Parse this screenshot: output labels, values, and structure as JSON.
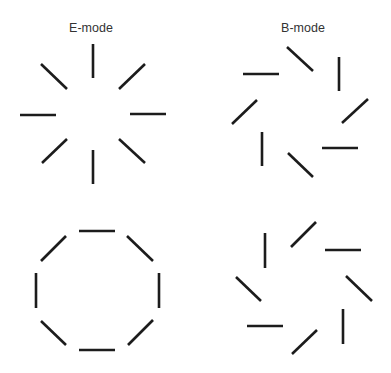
{
  "panels": [
    {
      "id": "e-mode-radial",
      "title": "E-mode",
      "pattern": "radial",
      "segment_count": 8,
      "segment_orientations_deg": [
        90,
        45,
        0,
        135,
        90,
        45,
        0,
        135
      ]
    },
    {
      "id": "b-mode-spiral",
      "title": "B-mode",
      "pattern": "spiral-clockwise",
      "segment_count": 8,
      "segment_orientations_deg": [
        135,
        90,
        45,
        0,
        135,
        90,
        45,
        0
      ]
    },
    {
      "id": "e-mode-tangential",
      "title": "",
      "pattern": "tangential",
      "segment_count": 8,
      "segment_orientations_deg": [
        0,
        135,
        90,
        45,
        0,
        135,
        90,
        45
      ]
    },
    {
      "id": "b-mode-spiral-counter",
      "title": "",
      "pattern": "spiral-counterclockwise",
      "segment_count": 8,
      "segment_orientations_deg": [
        45,
        0,
        135,
        90,
        45,
        0,
        135,
        90
      ]
    }
  ],
  "colors": {
    "segment": "#1c1c1c",
    "title": "#333333",
    "background": "#ffffff"
  }
}
